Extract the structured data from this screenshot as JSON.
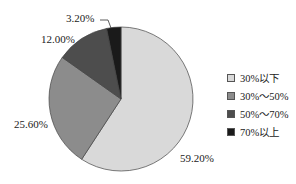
{
  "chart_data": {
    "type": "pie",
    "title": "",
    "categories": [
      "30%以下",
      "30%～50%",
      "50%～70%",
      "70%以上"
    ],
    "values": [
      59.2,
      25.6,
      12.0,
      3.2
    ],
    "labels": [
      "59.20%",
      "25.60%",
      "12.00%",
      "3.20%"
    ],
    "colors": [
      "#d9d9d9",
      "#8c8c8c",
      "#4d4d4d",
      "#1a1a1a"
    ],
    "start_angle": "12 o'clock, clockwise",
    "legend_position": "right"
  },
  "legend": [
    {
      "label": "30%以下",
      "color": "#d9d9d9"
    },
    {
      "label": "30%～50%",
      "color": "#8c8c8c"
    },
    {
      "label": "50%～70%",
      "color": "#4d4d4d"
    },
    {
      "label": "70%以上",
      "color": "#1a1a1a"
    }
  ]
}
